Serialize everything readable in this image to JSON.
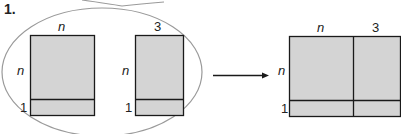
{
  "problem_number": "1.",
  "colors": {
    "fill": "#d4d4d4",
    "stroke": "#1a1a1a",
    "ellipse": "#9a9a9a",
    "text": "#222222"
  },
  "left_group": {
    "rect_a": {
      "top_label": "n",
      "side_label_top": "n",
      "side_label_bottom": "1"
    },
    "rect_b": {
      "top_label": "3",
      "side_label_top": "n",
      "side_label_bottom": "1"
    }
  },
  "arrow": {
    "direction": "right"
  },
  "result_rect": {
    "top_labels": [
      "n",
      "3"
    ],
    "side_label_top": "n",
    "side_label_bottom": "1"
  }
}
